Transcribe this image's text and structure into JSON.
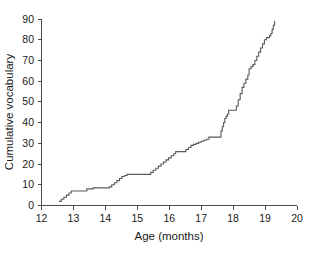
{
  "chart_data": {
    "type": "line",
    "title": "",
    "xlabel": "Age (months)",
    "ylabel": "Cumulative vocabulary",
    "xlim": [
      12,
      20
    ],
    "ylim": [
      0,
      90
    ],
    "xticks": [
      12,
      13,
      14,
      15,
      16,
      17,
      18,
      19,
      20
    ],
    "xtick_labels": [
      "12",
      "13",
      "14",
      "15",
      "16",
      "17",
      "18",
      "19",
      "20"
    ],
    "yticks": [
      0,
      10,
      20,
      30,
      40,
      50,
      60,
      70,
      80,
      90
    ],
    "ytick_labels": [
      "0",
      "10",
      "20",
      "30",
      "40",
      "50",
      "60",
      "70",
      "80",
      "90"
    ],
    "grid": false,
    "legend": null,
    "line_color": "#5a5a5a",
    "drawstyle": "steps-post",
    "series": [
      {
        "name": "Cumulative vocabulary",
        "x": [
          12.55,
          12.62,
          12.7,
          12.78,
          12.86,
          12.93,
          12.95,
          13.1,
          13.35,
          13.42,
          13.5,
          13.58,
          13.62,
          13.8,
          14.05,
          14.12,
          14.2,
          14.28,
          14.36,
          14.44,
          14.52,
          14.6,
          14.68,
          14.76,
          14.8,
          14.95,
          15.15,
          15.35,
          15.42,
          15.5,
          15.58,
          15.66,
          15.74,
          15.82,
          15.9,
          15.98,
          16.06,
          16.14,
          16.2,
          16.24,
          16.3,
          16.45,
          16.52,
          16.6,
          16.68,
          16.76,
          16.84,
          16.92,
          17.0,
          17.08,
          17.16,
          17.24,
          17.3,
          17.45,
          17.58,
          17.62,
          17.66,
          17.7,
          17.74,
          17.78,
          17.82,
          17.86,
          17.95,
          18.02,
          18.1,
          18.16,
          18.22,
          18.28,
          18.34,
          18.4,
          18.46,
          18.5,
          18.56,
          18.62,
          18.68,
          18.74,
          18.8,
          18.86,
          18.92,
          18.98,
          19.04,
          19.1,
          19.14,
          19.18,
          19.22,
          19.26,
          19.3
        ],
        "y": [
          2,
          3,
          4,
          5,
          6,
          7,
          7,
          7,
          7,
          8,
          8,
          8,
          8.5,
          8.5,
          8.5,
          9,
          10,
          11,
          12,
          13,
          14,
          14.5,
          15,
          15,
          15,
          15,
          15,
          15,
          16,
          17,
          18,
          19,
          20,
          21,
          22,
          23,
          24,
          25,
          26,
          26,
          26,
          26,
          27,
          28,
          29,
          29.5,
          30,
          30.5,
          31,
          31.5,
          32,
          33,
          33,
          33,
          33,
          36,
          38,
          40,
          42,
          43,
          44,
          46,
          46,
          46,
          48,
          51,
          54,
          57,
          59,
          61,
          63,
          66,
          67,
          68,
          70,
          72,
          74,
          76,
          78,
          80,
          81,
          81,
          82,
          83,
          85,
          87,
          89
        ]
      }
    ]
  },
  "axes": {
    "x_title": "Age (months)",
    "y_title": "Cumulative vocabulary"
  }
}
